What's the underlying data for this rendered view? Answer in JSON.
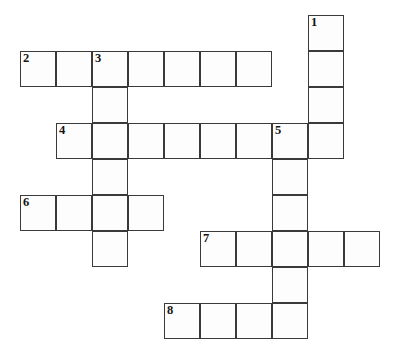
{
  "puzzle": {
    "type": "crossword-grid",
    "title": "Crossword Puzzle Grid",
    "geometry": {
      "cell_size": 36,
      "origin_x": 20,
      "origin_y": 15,
      "columns": 11,
      "rows": 10,
      "cell_fill": "#fdfdfd",
      "cell_border": "#3a3a3a",
      "background": "#ffffff",
      "number_color": "#131313"
    },
    "entries": [
      {
        "number": "1",
        "direction": "down",
        "length": 4,
        "start_col": 8,
        "start_row": 0,
        "label": "1-down"
      },
      {
        "number": "2",
        "direction": "across",
        "length": 7,
        "start_col": 0,
        "start_row": 1,
        "label": "2-across"
      },
      {
        "number": "3",
        "direction": "down",
        "length": 6,
        "start_col": 2,
        "start_row": 1,
        "label": "3-down"
      },
      {
        "number": "4",
        "direction": "across",
        "length": 8,
        "start_col": 1,
        "start_row": 3,
        "label": "4-across"
      },
      {
        "number": "5",
        "direction": "down",
        "length": 6,
        "start_col": 7,
        "start_row": 3,
        "label": "5-down"
      },
      {
        "number": "6",
        "direction": "across",
        "length": 4,
        "start_col": 0,
        "start_row": 5,
        "label": "6-across"
      },
      {
        "number": "7",
        "direction": "across",
        "length": 5,
        "start_col": 5,
        "start_row": 6,
        "label": "7-across"
      },
      {
        "number": "8",
        "direction": "across",
        "length": 4,
        "start_col": 4,
        "start_row": 8,
        "label": "8-across"
      }
    ],
    "cells": [
      {
        "col": 8,
        "row": 0,
        "number": "1",
        "value": ""
      },
      {
        "col": 8,
        "row": 1,
        "number": "",
        "value": ""
      },
      {
        "col": 8,
        "row": 2,
        "number": "",
        "value": ""
      },
      {
        "col": 8,
        "row": 3,
        "number": "",
        "value": ""
      },
      {
        "col": 0,
        "row": 1,
        "number": "2",
        "value": ""
      },
      {
        "col": 1,
        "row": 1,
        "number": "",
        "value": ""
      },
      {
        "col": 2,
        "row": 1,
        "number": "3",
        "value": ""
      },
      {
        "col": 3,
        "row": 1,
        "number": "",
        "value": ""
      },
      {
        "col": 4,
        "row": 1,
        "number": "",
        "value": ""
      },
      {
        "col": 5,
        "row": 1,
        "number": "",
        "value": ""
      },
      {
        "col": 6,
        "row": 1,
        "number": "",
        "value": ""
      },
      {
        "col": 2,
        "row": 2,
        "number": "",
        "value": ""
      },
      {
        "col": 2,
        "row": 3,
        "number": "",
        "value": ""
      },
      {
        "col": 2,
        "row": 4,
        "number": "",
        "value": ""
      },
      {
        "col": 2,
        "row": 5,
        "number": "",
        "value": ""
      },
      {
        "col": 2,
        "row": 6,
        "number": "",
        "value": ""
      },
      {
        "col": 1,
        "row": 3,
        "number": "4",
        "value": ""
      },
      {
        "col": 3,
        "row": 3,
        "number": "",
        "value": ""
      },
      {
        "col": 4,
        "row": 3,
        "number": "",
        "value": ""
      },
      {
        "col": 5,
        "row": 3,
        "number": "",
        "value": ""
      },
      {
        "col": 6,
        "row": 3,
        "number": "",
        "value": ""
      },
      {
        "col": 7,
        "row": 3,
        "number": "5",
        "value": ""
      },
      {
        "col": 7,
        "row": 4,
        "number": "",
        "value": ""
      },
      {
        "col": 7,
        "row": 5,
        "number": "",
        "value": ""
      },
      {
        "col": 7,
        "row": 6,
        "number": "",
        "value": ""
      },
      {
        "col": 7,
        "row": 7,
        "number": "",
        "value": ""
      },
      {
        "col": 7,
        "row": 8,
        "number": "",
        "value": ""
      },
      {
        "col": 0,
        "row": 5,
        "number": "6",
        "value": ""
      },
      {
        "col": 1,
        "row": 5,
        "number": "",
        "value": ""
      },
      {
        "col": 3,
        "row": 5,
        "number": "",
        "value": ""
      },
      {
        "col": 5,
        "row": 6,
        "number": "7",
        "value": ""
      },
      {
        "col": 6,
        "row": 6,
        "number": "",
        "value": ""
      },
      {
        "col": 8,
        "row": 6,
        "number": "",
        "value": ""
      },
      {
        "col": 9,
        "row": 6,
        "number": "",
        "value": ""
      },
      {
        "col": 4,
        "row": 8,
        "number": "8",
        "value": ""
      },
      {
        "col": 5,
        "row": 8,
        "number": "",
        "value": ""
      },
      {
        "col": 6,
        "row": 8,
        "number": "",
        "value": ""
      }
    ]
  }
}
